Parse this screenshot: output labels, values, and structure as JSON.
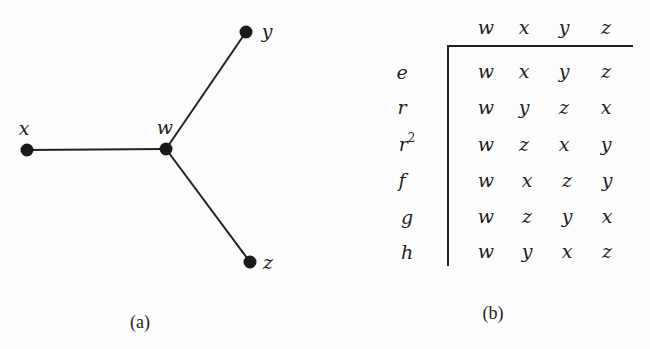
{
  "figure_a": {
    "caption": "(a)",
    "nodes": [
      {
        "id": "x",
        "label": "x"
      },
      {
        "id": "w",
        "label": "w"
      },
      {
        "id": "y",
        "label": "y"
      },
      {
        "id": "z",
        "label": "z"
      }
    ],
    "edges": [
      [
        "x",
        "w"
      ],
      [
        "w",
        "y"
      ],
      [
        "w",
        "z"
      ]
    ]
  },
  "figure_b": {
    "caption": "(b)",
    "columns": [
      "w",
      "x",
      "y",
      "z"
    ],
    "rows": [
      {
        "label": "e",
        "sup": "",
        "values": [
          "w",
          "x",
          "y",
          "z"
        ]
      },
      {
        "label": "r",
        "sup": "",
        "values": [
          "w",
          "y",
          "z",
          "x"
        ]
      },
      {
        "label": "r",
        "sup": "2",
        "values": [
          "w",
          "z",
          "x",
          "y"
        ]
      },
      {
        "label": "f",
        "sup": "",
        "values": [
          "w",
          "x",
          "z",
          "y"
        ]
      },
      {
        "label": "g",
        "sup": "",
        "values": [
          "w",
          "z",
          "y",
          "x"
        ]
      },
      {
        "label": "h",
        "sup": "",
        "values": [
          "w",
          "y",
          "x",
          "z"
        ]
      }
    ]
  }
}
